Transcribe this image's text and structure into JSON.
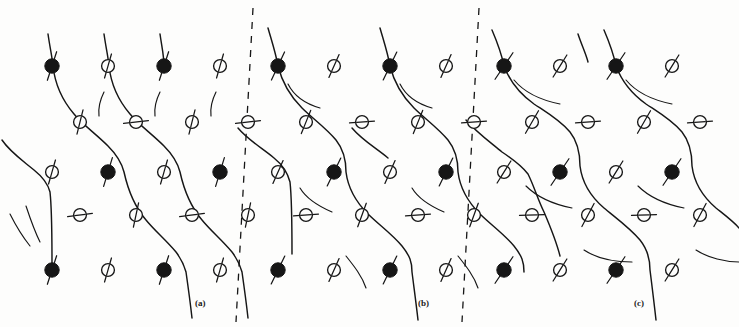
{
  "figure": {
    "kind": "lattice-spin-diagram",
    "width": 739,
    "height": 327,
    "background": "#fdfdfc",
    "ink": "#161616"
  },
  "panels": [
    {
      "id": "a",
      "label": "(a)",
      "label_x": 195,
      "label_y": 298
    },
    {
      "id": "b",
      "label": "(b)",
      "label_x": 418,
      "label_y": 298
    },
    {
      "id": "c",
      "label": "(c)",
      "label_x": 634,
      "label_y": 298
    }
  ],
  "domain_walls": [
    {
      "name": "wall-a-b",
      "x_top": 253,
      "y_top": 8,
      "x_bottom": 236,
      "y_bottom": 322,
      "dash": "7 7",
      "width": 1.3
    },
    {
      "name": "wall-b-c",
      "x_top": 479,
      "y_top": 8,
      "x_bottom": 462,
      "y_bottom": 322,
      "dash": "7 7",
      "width": 1.3
    }
  ],
  "legend": {
    "filled_site": "filled-black-circle-atom",
    "open_site": "open-circle-atom",
    "spin_bar": "spin-direction-bar",
    "chain": "zigzag-bond-chain"
  },
  "geometry": {
    "col_spacing": 55.8,
    "row_y": [
      66,
      172,
      215,
      270
    ],
    "mid_row_y": 122,
    "filled_r": 7.2,
    "open_r": 6.4
  },
  "atoms": [
    {
      "id": "a-r1-c1",
      "x": 52,
      "y": 66,
      "type": "filled",
      "angle": 72,
      "len": 30,
      "panel": "a"
    },
    {
      "id": "a-r1-c2",
      "x": 108,
      "y": 66,
      "type": "open",
      "angle": 74,
      "len": 25,
      "panel": "a"
    },
    {
      "id": "a-r1-c3",
      "x": 164,
      "y": 66,
      "type": "filled",
      "angle": 72,
      "len": 30,
      "panel": "a"
    },
    {
      "id": "a-r1-c4",
      "x": 220,
      "y": 66,
      "type": "open",
      "angle": 74,
      "len": 25,
      "panel": "a"
    },
    {
      "id": "b-r1-c1",
      "x": 278,
      "y": 66,
      "type": "filled",
      "angle": 65,
      "len": 31,
      "panel": "b"
    },
    {
      "id": "b-r1-c2",
      "x": 334,
      "y": 66,
      "type": "open",
      "angle": 66,
      "len": 25,
      "panel": "b"
    },
    {
      "id": "b-r1-c3",
      "x": 390,
      "y": 66,
      "type": "filled",
      "angle": 64,
      "len": 31,
      "panel": "b"
    },
    {
      "id": "b-r1-c4",
      "x": 446,
      "y": 66,
      "type": "open",
      "angle": 66,
      "len": 25,
      "panel": "b"
    },
    {
      "id": "c-r1-c1",
      "x": 504,
      "y": 66,
      "type": "filled",
      "angle": 56,
      "len": 32,
      "panel": "c"
    },
    {
      "id": "c-r1-c2",
      "x": 560,
      "y": 66,
      "type": "open",
      "angle": 58,
      "len": 26,
      "panel": "c"
    },
    {
      "id": "c-r1-c3",
      "x": 616,
      "y": 66,
      "type": "filled",
      "angle": 56,
      "len": 32,
      "panel": "c"
    },
    {
      "id": "c-r1-c4",
      "x": 672,
      "y": 66,
      "type": "open",
      "angle": 58,
      "len": 26,
      "panel": "c"
    },
    {
      "id": "a-r2-c1",
      "x": 80,
      "y": 122,
      "type": "open",
      "angle": 76,
      "len": 25,
      "panel": "a"
    },
    {
      "id": "a-r2-c2",
      "x": 136,
      "y": 122,
      "type": "open",
      "angle": 6,
      "len": 25,
      "panel": "a"
    },
    {
      "id": "a-r2-c3",
      "x": 192,
      "y": 122,
      "type": "open",
      "angle": 76,
      "len": 25,
      "panel": "a"
    },
    {
      "id": "a-r2-c4",
      "x": 248,
      "y": 122,
      "type": "open",
      "angle": 6,
      "len": 25,
      "panel": "a"
    },
    {
      "id": "b-r2-c1",
      "x": 306,
      "y": 122,
      "type": "open",
      "angle": 68,
      "len": 25,
      "panel": "b"
    },
    {
      "id": "b-r2-c2",
      "x": 362,
      "y": 122,
      "type": "open",
      "angle": 4,
      "len": 25,
      "panel": "b"
    },
    {
      "id": "b-r2-c3",
      "x": 418,
      "y": 122,
      "type": "open",
      "angle": 68,
      "len": 25,
      "panel": "b"
    },
    {
      "id": "b-r2-c4",
      "x": 474,
      "y": 122,
      "type": "open",
      "angle": 4,
      "len": 25,
      "panel": "b"
    },
    {
      "id": "c-r2-c1",
      "x": 532,
      "y": 122,
      "type": "open",
      "angle": 60,
      "len": 26,
      "panel": "c"
    },
    {
      "id": "c-r2-c2",
      "x": 588,
      "y": 122,
      "type": "open",
      "angle": 4,
      "len": 25,
      "panel": "c"
    },
    {
      "id": "c-r2-c3",
      "x": 644,
      "y": 122,
      "type": "open",
      "angle": 60,
      "len": 26,
      "panel": "c"
    },
    {
      "id": "c-r2-c4",
      "x": 700,
      "y": 122,
      "type": "open",
      "angle": 4,
      "len": 25,
      "panel": "c"
    },
    {
      "id": "a-r3-c1",
      "x": 52,
      "y": 172,
      "type": "open",
      "angle": 74,
      "len": 25,
      "panel": "a"
    },
    {
      "id": "a-r3-c2",
      "x": 108,
      "y": 172,
      "type": "filled",
      "angle": 73,
      "len": 30,
      "panel": "a"
    },
    {
      "id": "a-r3-c3",
      "x": 164,
      "y": 172,
      "type": "open",
      "angle": 74,
      "len": 25,
      "panel": "a"
    },
    {
      "id": "a-r3-c4",
      "x": 220,
      "y": 172,
      "type": "filled",
      "angle": 73,
      "len": 30,
      "panel": "a"
    },
    {
      "id": "b-r3-c1",
      "x": 278,
      "y": 172,
      "type": "open",
      "angle": 66,
      "len": 25,
      "panel": "b"
    },
    {
      "id": "b-r3-c2",
      "x": 334,
      "y": 172,
      "type": "filled",
      "angle": 64,
      "len": 31,
      "panel": "b"
    },
    {
      "id": "b-r3-c3",
      "x": 390,
      "y": 172,
      "type": "open",
      "angle": 66,
      "len": 25,
      "panel": "b"
    },
    {
      "id": "b-r3-c4",
      "x": 446,
      "y": 172,
      "type": "filled",
      "angle": 64,
      "len": 31,
      "panel": "b"
    },
    {
      "id": "c-r3-c1",
      "x": 504,
      "y": 172,
      "type": "open",
      "angle": 58,
      "len": 26,
      "panel": "c"
    },
    {
      "id": "c-r3-c2",
      "x": 560,
      "y": 172,
      "type": "filled",
      "angle": 56,
      "len": 32,
      "panel": "c"
    },
    {
      "id": "c-r3-c3",
      "x": 616,
      "y": 172,
      "type": "open",
      "angle": 58,
      "len": 26,
      "panel": "c"
    },
    {
      "id": "c-r3-c4",
      "x": 672,
      "y": 172,
      "type": "filled",
      "angle": 56,
      "len": 32,
      "panel": "c"
    },
    {
      "id": "a-r4-c1",
      "x": 80,
      "y": 215,
      "type": "open",
      "angle": 8,
      "len": 25,
      "panel": "a"
    },
    {
      "id": "a-r4-c2",
      "x": 136,
      "y": 215,
      "type": "open",
      "angle": 78,
      "len": 25,
      "panel": "a"
    },
    {
      "id": "a-r4-c3",
      "x": 192,
      "y": 215,
      "type": "open",
      "angle": 8,
      "len": 25,
      "panel": "a"
    },
    {
      "id": "a-r4-c4",
      "x": 248,
      "y": 215,
      "type": "open",
      "angle": 78,
      "len": 25,
      "panel": "a"
    },
    {
      "id": "b-r4-c1",
      "x": 306,
      "y": 215,
      "type": "open",
      "angle": 4,
      "len": 25,
      "panel": "b"
    },
    {
      "id": "b-r4-c2",
      "x": 362,
      "y": 215,
      "type": "open",
      "angle": 70,
      "len": 25,
      "panel": "b"
    },
    {
      "id": "b-r4-c3",
      "x": 418,
      "y": 215,
      "type": "open",
      "angle": 4,
      "len": 25,
      "panel": "b"
    },
    {
      "id": "b-r4-c4",
      "x": 474,
      "y": 215,
      "type": "open",
      "angle": 70,
      "len": 25,
      "panel": "b"
    },
    {
      "id": "c-r4-c1",
      "x": 532,
      "y": 215,
      "type": "open",
      "angle": 2,
      "len": 25,
      "panel": "c"
    },
    {
      "id": "c-r4-c2",
      "x": 588,
      "y": 215,
      "type": "open",
      "angle": 62,
      "len": 26,
      "panel": "c"
    },
    {
      "id": "c-r4-c3",
      "x": 644,
      "y": 215,
      "type": "open",
      "angle": 2,
      "len": 25,
      "panel": "c"
    },
    {
      "id": "c-r4-c4",
      "x": 700,
      "y": 215,
      "type": "open",
      "angle": 62,
      "len": 26,
      "panel": "c"
    },
    {
      "id": "a-r5-c1",
      "x": 52,
      "y": 270,
      "type": "filled",
      "angle": 72,
      "len": 30,
      "panel": "a"
    },
    {
      "id": "a-r5-c2",
      "x": 108,
      "y": 270,
      "type": "open",
      "angle": 74,
      "len": 25,
      "panel": "a"
    },
    {
      "id": "a-r5-c3",
      "x": 164,
      "y": 270,
      "type": "filled",
      "angle": 72,
      "len": 30,
      "panel": "a"
    },
    {
      "id": "a-r5-c4",
      "x": 220,
      "y": 270,
      "type": "open",
      "angle": 74,
      "len": 25,
      "panel": "a"
    },
    {
      "id": "b-r5-c1",
      "x": 278,
      "y": 270,
      "type": "filled",
      "angle": 64,
      "len": 31,
      "panel": "b"
    },
    {
      "id": "b-r5-c2",
      "x": 334,
      "y": 270,
      "type": "open",
      "angle": 66,
      "len": 25,
      "panel": "b"
    },
    {
      "id": "b-r5-c3",
      "x": 390,
      "y": 270,
      "type": "filled",
      "angle": 64,
      "len": 31,
      "panel": "b"
    },
    {
      "id": "b-r5-c4",
      "x": 446,
      "y": 270,
      "type": "open",
      "angle": 66,
      "len": 25,
      "panel": "b"
    },
    {
      "id": "c-r5-c1",
      "x": 504,
      "y": 270,
      "type": "filled",
      "angle": 56,
      "len": 32,
      "panel": "c"
    },
    {
      "id": "c-r5-c2",
      "x": 560,
      "y": 270,
      "type": "open",
      "angle": 58,
      "len": 26,
      "panel": "c"
    },
    {
      "id": "c-r5-c3",
      "x": 616,
      "y": 270,
      "type": "filled",
      "angle": 56,
      "len": 32,
      "panel": "c"
    },
    {
      "id": "c-r5-c4",
      "x": 672,
      "y": 270,
      "type": "open",
      "angle": 58,
      "len": 26,
      "panel": "c"
    }
  ],
  "chains": [
    {
      "id": "chain-a-1",
      "panel": "a",
      "d": "M 48 34 C 50 48, 52 56, 53 66 C 55 84, 62 100, 74 114 C 82 124, 96 134, 108 146 C 118 156, 122 164, 124 172 C 128 190, 134 206, 146 220 C 154 230, 166 240, 176 252 C 182 260, 184 265, 186 272 C 188 286, 190 300, 192 318"
    },
    {
      "id": "chain-a-2",
      "panel": "a",
      "d": "M 104 34 C 106 48, 108 56, 109 66 C 111 84, 118 100, 130 114 C 138 124, 152 134, 164 146 C 174 156, 178 164, 180 172 C 184 190, 190 206, 202 220 C 210 230, 222 240, 232 252 C 238 260, 240 265, 242 272 C 244 286, 246 300, 248 318"
    },
    {
      "id": "chain-a-3",
      "panel": "a",
      "d": "M 2 140 C 10 152, 22 160, 34 170 C 44 178, 48 184, 50 192 C 52 210, 52 236, 52 264"
    },
    {
      "id": "chain-a-4",
      "panel": "a",
      "d": "M 160 34 C 162 48, 164 56, 164 66"
    },
    {
      "id": "chain-b-1",
      "panel": "b",
      "d": "M 268 28 C 272 42, 276 54, 278 66 C 282 82, 290 96, 302 108 C 312 118, 326 128, 336 140 C 344 150, 346 160, 346 172 C 348 188, 356 202, 368 214 C 378 224, 392 234, 402 246 C 410 256, 412 262, 412 272 C 414 288, 416 302, 418 320"
    },
    {
      "id": "chain-b-2",
      "panel": "b",
      "d": "M 380 28 C 384 42, 388 54, 390 66 C 394 82, 402 96, 414 108 C 424 118, 438 128, 448 140 C 456 150, 458 160, 458 172 C 460 188, 468 202, 480 214 C 490 224, 504 234, 514 246 C 522 256, 524 262, 524 272"
    },
    {
      "id": "chain-b-3",
      "panel": "b",
      "d": "M 238 128 C 248 140, 262 148, 274 158 C 284 166, 288 174, 290 182 C 292 200, 292 226, 292 254"
    },
    {
      "id": "chain-b-4",
      "panel": "b",
      "d": "M 352 128 C 362 140, 376 148, 388 158"
    },
    {
      "id": "chain-c-1",
      "panel": "c",
      "d": "M 492 30 C 498 44, 502 56, 504 66 C 510 82, 520 94, 534 104 C 546 112, 560 120, 570 132 C 578 142, 580 154, 580 166 C 582 182, 590 196, 604 208 C 616 218, 630 228, 640 240 C 648 250, 650 260, 650 270 C 652 286, 654 302, 656 320"
    },
    {
      "id": "chain-c-2",
      "panel": "c",
      "d": "M 604 30 C 610 44, 614 56, 616 66 C 622 82, 632 94, 646 104 C 658 112, 672 120, 682 132 C 690 142, 692 154, 692 166 C 694 182, 702 196, 716 208 C 726 216, 734 222, 739 228"
    },
    {
      "id": "chain-c-3",
      "panel": "c",
      "d": "M 466 120 C 476 132, 490 142, 502 152 C 514 160, 522 166, 528 174 C 534 186, 538 200, 544 212 C 550 226, 556 240, 560 256"
    },
    {
      "id": "chain-c-4",
      "panel": "c",
      "d": "M 578 34 C 582 46, 586 54, 588 62"
    },
    {
      "id": "spur-a-1",
      "panel": "a",
      "d": "M 104 92 C 100 100, 98 108, 99 116"
    },
    {
      "id": "spur-a-2",
      "panel": "a",
      "d": "M 160 92 C 156 100, 154 108, 155 116"
    },
    {
      "id": "spur-a-3",
      "panel": "a",
      "d": "M 216 92 C 212 100, 210 108, 211 116"
    },
    {
      "id": "spur-b-1",
      "panel": "b",
      "d": "M 288 84 C 294 96, 306 104, 320 108"
    },
    {
      "id": "spur-b-2",
      "panel": "b",
      "d": "M 400 84 C 406 96, 418 104, 432 108"
    },
    {
      "id": "spur-b-3",
      "panel": "b",
      "d": "M 300 188 C 306 198, 318 206, 332 212"
    },
    {
      "id": "spur-b-4",
      "panel": "b",
      "d": "M 412 188 C 418 198, 430 206, 444 212"
    },
    {
      "id": "spur-c-1",
      "panel": "c",
      "d": "M 514 80 C 524 92, 540 100, 560 104"
    },
    {
      "id": "spur-c-2",
      "panel": "c",
      "d": "M 626 80 C 636 92, 652 100, 672 104"
    },
    {
      "id": "spur-c-3",
      "panel": "c",
      "d": "M 526 186 C 536 196, 552 204, 572 208"
    },
    {
      "id": "spur-c-4",
      "panel": "c",
      "d": "M 638 186 C 648 196, 664 204, 684 208"
    },
    {
      "id": "spur-c-5",
      "panel": "c",
      "d": "M 584 250 C 596 258, 614 262, 632 262"
    },
    {
      "id": "spur-c-6",
      "panel": "c",
      "d": "M 696 250 C 708 258, 726 262, 739 262"
    },
    {
      "id": "spur-b-5",
      "panel": "b",
      "d": "M 346 256 C 354 266, 362 276, 366 288"
    },
    {
      "id": "spur-b-6",
      "panel": "b",
      "d": "M 458 256 C 466 266, 474 276, 478 288"
    },
    {
      "id": "spur-a-5",
      "panel": "a",
      "d": "M 26 206 C 30 218, 34 230, 40 242"
    },
    {
      "id": "spur-a-6",
      "panel": "a",
      "d": "M 10 214 C 16 226, 22 236, 30 246"
    }
  ]
}
